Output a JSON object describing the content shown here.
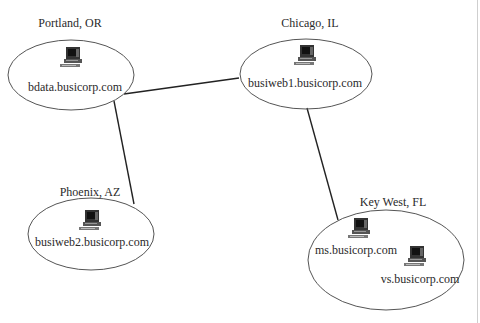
{
  "diagram": {
    "type": "network-topology",
    "sites": [
      {
        "id": "portland",
        "location": "Portland, OR",
        "hosts": [
          "bdata.busicorp.com"
        ]
      },
      {
        "id": "chicago",
        "location": "Chicago, IL",
        "hosts": [
          "busiweb1.busicorp.com"
        ]
      },
      {
        "id": "phoenix",
        "location": "Phoenix, AZ",
        "hosts": [
          "busiweb2.busicorp.com"
        ]
      },
      {
        "id": "keywest",
        "location": "Key West, FL",
        "hosts": [
          "ms.busicorp.com",
          "vs.busicorp.com"
        ]
      }
    ],
    "links": [
      {
        "from": "portland",
        "to": "chicago"
      },
      {
        "from": "portland",
        "to": "phoenix"
      },
      {
        "from": "chicago",
        "to": "keywest"
      }
    ],
    "icon": "computer-icon",
    "colors": {
      "line": "#222222",
      "ellipse": "#555555",
      "text": "#2a2a2a"
    }
  }
}
